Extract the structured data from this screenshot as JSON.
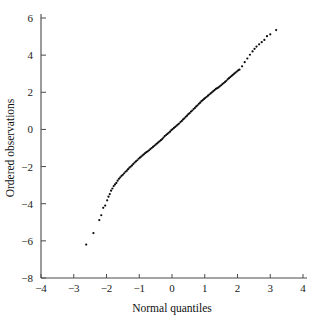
{
  "chart_data": {
    "type": "scatter",
    "title": "",
    "subtitle": "",
    "xlabel": "Normal quantiles",
    "ylabel": "Ordered observations",
    "xlim": [
      -4,
      4
    ],
    "ylim": [
      -8,
      6
    ],
    "xticks": [
      -4,
      -3,
      -2,
      -1,
      0,
      1,
      2,
      3,
      4
    ],
    "xticklabels": [
      "−4",
      "−3",
      "−2",
      "−1",
      "0",
      "1",
      "2",
      "3",
      "4"
    ],
    "yticks": [
      -8,
      -6,
      -4,
      -2,
      0,
      2,
      4,
      6
    ],
    "yticklabels": [
      "−8",
      "−6",
      "−4",
      "−2",
      "0",
      "2",
      "4",
      "6"
    ],
    "grid": false,
    "legend": null,
    "marker": "dot",
    "marker_color": "#0a0a0a",
    "marker_size": 1.1,
    "series": [
      {
        "name": "Ordered observations vs normal quantiles",
        "points": [
          [
            -2.62,
            -6.2
          ],
          [
            -2.4,
            -5.58
          ],
          [
            -2.22,
            -4.88
          ],
          [
            -2.16,
            -4.62
          ],
          [
            -2.1,
            -4.22
          ],
          [
            -2.04,
            -4.1
          ],
          [
            -1.98,
            -3.82
          ],
          [
            -1.94,
            -3.62
          ],
          [
            -1.9,
            -3.48
          ],
          [
            -1.86,
            -3.3
          ],
          [
            -1.82,
            -3.18
          ],
          [
            -1.78,
            -3.05
          ],
          [
            -1.74,
            -2.96
          ],
          [
            -1.7,
            -2.88
          ],
          [
            -1.66,
            -2.76
          ],
          [
            -1.62,
            -2.66
          ],
          [
            -1.58,
            -2.58
          ],
          [
            -1.54,
            -2.5
          ],
          [
            -1.5,
            -2.44
          ],
          [
            -1.46,
            -2.36
          ],
          [
            -1.42,
            -2.28
          ],
          [
            -1.38,
            -2.22
          ],
          [
            -1.34,
            -2.14
          ],
          [
            -1.3,
            -2.06
          ],
          [
            -1.26,
            -2.0
          ],
          [
            -1.22,
            -1.94
          ],
          [
            -1.18,
            -1.86
          ],
          [
            -1.14,
            -1.78
          ],
          [
            -1.1,
            -1.72
          ],
          [
            -1.06,
            -1.66
          ],
          [
            -1.02,
            -1.58
          ],
          [
            -0.98,
            -1.52
          ],
          [
            -0.94,
            -1.46
          ],
          [
            -0.9,
            -1.4
          ],
          [
            -0.86,
            -1.34
          ],
          [
            -0.82,
            -1.28
          ],
          [
            -0.78,
            -1.22
          ],
          [
            -0.74,
            -1.18
          ],
          [
            -0.7,
            -1.12
          ],
          [
            -0.66,
            -1.06
          ],
          [
            -0.62,
            -1.0
          ],
          [
            -0.58,
            -0.94
          ],
          [
            -0.54,
            -0.88
          ],
          [
            -0.5,
            -0.82
          ],
          [
            -0.46,
            -0.76
          ],
          [
            -0.42,
            -0.7
          ],
          [
            -0.38,
            -0.64
          ],
          [
            -0.34,
            -0.58
          ],
          [
            -0.3,
            -0.52
          ],
          [
            -0.26,
            -0.44
          ],
          [
            -0.22,
            -0.36
          ],
          [
            -0.18,
            -0.3
          ],
          [
            -0.14,
            -0.24
          ],
          [
            -0.1,
            -0.18
          ],
          [
            -0.06,
            -0.12
          ],
          [
            -0.02,
            -0.04
          ],
          [
            0.02,
            0.02
          ],
          [
            0.06,
            0.08
          ],
          [
            0.1,
            0.14
          ],
          [
            0.14,
            0.2
          ],
          [
            0.18,
            0.26
          ],
          [
            0.22,
            0.32
          ],
          [
            0.26,
            0.4
          ],
          [
            0.3,
            0.46
          ],
          [
            0.34,
            0.54
          ],
          [
            0.38,
            0.6
          ],
          [
            0.42,
            0.68
          ],
          [
            0.46,
            0.74
          ],
          [
            0.5,
            0.82
          ],
          [
            0.54,
            0.88
          ],
          [
            0.58,
            0.96
          ],
          [
            0.62,
            1.02
          ],
          [
            0.66,
            1.1
          ],
          [
            0.7,
            1.16
          ],
          [
            0.74,
            1.24
          ],
          [
            0.78,
            1.3
          ],
          [
            0.82,
            1.38
          ],
          [
            0.86,
            1.44
          ],
          [
            0.9,
            1.52
          ],
          [
            0.94,
            1.58
          ],
          [
            0.98,
            1.64
          ],
          [
            1.02,
            1.7
          ],
          [
            1.06,
            1.76
          ],
          [
            1.1,
            1.82
          ],
          [
            1.14,
            1.88
          ],
          [
            1.18,
            1.94
          ],
          [
            1.22,
            2.0
          ],
          [
            1.26,
            2.06
          ],
          [
            1.3,
            2.12
          ],
          [
            1.34,
            2.18
          ],
          [
            1.38,
            2.22
          ],
          [
            1.42,
            2.26
          ],
          [
            1.46,
            2.32
          ],
          [
            1.5,
            2.38
          ],
          [
            1.54,
            2.44
          ],
          [
            1.58,
            2.5
          ],
          [
            1.62,
            2.56
          ],
          [
            1.66,
            2.62
          ],
          [
            1.7,
            2.7
          ],
          [
            1.74,
            2.76
          ],
          [
            1.78,
            2.82
          ],
          [
            1.82,
            2.88
          ],
          [
            1.86,
            2.94
          ],
          [
            1.9,
            3.0
          ],
          [
            1.94,
            3.06
          ],
          [
            1.98,
            3.12
          ],
          [
            2.02,
            3.18
          ],
          [
            2.06,
            3.22
          ],
          [
            2.14,
            3.4
          ],
          [
            2.22,
            3.62
          ],
          [
            2.3,
            3.82
          ],
          [
            2.38,
            4.02
          ],
          [
            2.46,
            4.2
          ],
          [
            2.52,
            4.34
          ],
          [
            2.58,
            4.46
          ],
          [
            2.66,
            4.58
          ],
          [
            2.74,
            4.7
          ],
          [
            2.82,
            4.82
          ],
          [
            2.9,
            5.02
          ],
          [
            3.0,
            5.12
          ],
          [
            3.18,
            5.35
          ]
        ]
      }
    ],
    "annotations": []
  },
  "figure": {
    "background_color": "#ffffff",
    "axis_color": "#4a4a4a",
    "text_color": "#111111"
  }
}
